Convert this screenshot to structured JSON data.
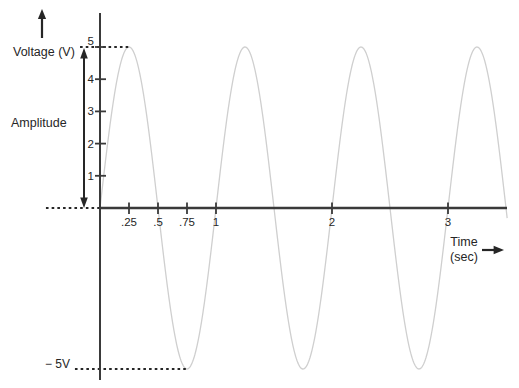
{
  "chart_data": {
    "type": "line",
    "ylabel": "Voltage (V)",
    "xlabel": "Time",
    "xlabel_units": "(sec)",
    "annotations": {
      "amplitude_label": "Amplitude",
      "neg_peak_label": "− 5V",
      "pos_peak_volts": 5,
      "neg_peak_volts": -5
    },
    "wave": {
      "shape": "sine",
      "amplitude": 5,
      "frequency": 1,
      "t_start": 0,
      "t_end": 3.51
    },
    "x_ticks": [
      {
        "value": 0.25,
        "label": ".25"
      },
      {
        "value": 0.5,
        "label": ".5"
      },
      {
        "value": 0.75,
        "label": ".75"
      },
      {
        "value": 1,
        "label": "1"
      },
      {
        "value": 2,
        "label": "2"
      },
      {
        "value": 3,
        "label": "3"
      }
    ],
    "y_ticks": [
      {
        "value": 1,
        "label": "1"
      },
      {
        "value": 2,
        "label": "2"
      },
      {
        "value": 3,
        "label": "3"
      },
      {
        "value": 4,
        "label": "4"
      },
      {
        "value": 5,
        "label": "5"
      }
    ],
    "xlim": [
      0,
      3.55
    ],
    "ylim": [
      -5,
      5
    ],
    "gridlines": false,
    "legend": false,
    "guides": [
      {
        "voltage": 5,
        "from_sec": -0.172,
        "to_sec": 0.25
      },
      {
        "voltage": 0,
        "from_sec": -0.466,
        "to_sec": 0
      },
      {
        "voltage": -5,
        "from_sec": -0.216,
        "to_sec": 0.75
      }
    ],
    "colors": {
      "waveform": "#cfcfcf",
      "axis": "#3a3a3a",
      "text": "#262626"
    }
  }
}
